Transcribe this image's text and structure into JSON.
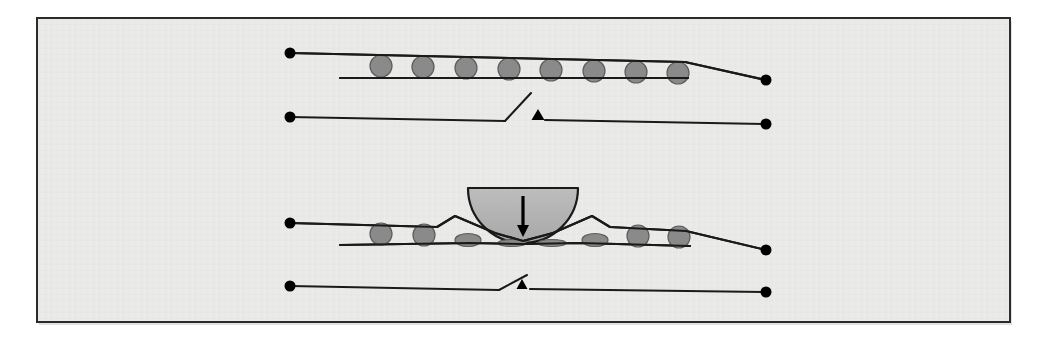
{
  "figure": {
    "panel": {
      "background_color": "#e9e9e7",
      "border_color": "#2b2b2b",
      "x": 37,
      "y": 18,
      "width": 973,
      "height": 304
    },
    "colors": {
      "page_background": "#ffffff",
      "panel_fill": "#e9e9e7",
      "panel_border": "#2b2b2b",
      "line": "#1a1a1a",
      "bead_fill": "#8a8a8a",
      "bead_stroke": "#5d5d5d",
      "indenter_fill": "#b3b3b3",
      "indenter_stroke": "#1a1a1a",
      "node_dot": "#000000",
      "arrow": "#000000"
    }
  },
  "panels": [
    {
      "id": "upper",
      "name": "undeformed-state",
      "label": "relaxed / open",
      "channel": {
        "left_node": {
          "x": 290,
          "y": 53
        },
        "right_node": {
          "x": 766,
          "y": 80
        },
        "top_rail": [
          [
            290,
            53
          ],
          [
            685,
            62
          ],
          [
            766,
            80
          ]
        ],
        "bottom_rail": [
          [
            340,
            78
          ],
          [
            688,
            78
          ]
        ],
        "bead_count": 8,
        "bead_radius": 11,
        "beads": [
          {
            "cx": 381,
            "cy": 66,
            "rx": 11,
            "ry": 11,
            "state": "round"
          },
          {
            "cx": 423,
            "cy": 67,
            "rx": 11,
            "ry": 11,
            "state": "round"
          },
          {
            "cx": 466,
            "cy": 68,
            "rx": 11,
            "ry": 11,
            "state": "round"
          },
          {
            "cx": 509,
            "cy": 69,
            "rx": 11,
            "ry": 11,
            "state": "round"
          },
          {
            "cx": 551,
            "cy": 70,
            "rx": 11,
            "ry": 11,
            "state": "round"
          },
          {
            "cx": 594,
            "cy": 71,
            "rx": 11,
            "ry": 11,
            "state": "round"
          },
          {
            "cx": 636,
            "cy": 72,
            "rx": 11,
            "ry": 11,
            "state": "round"
          },
          {
            "cx": 678,
            "cy": 73,
            "rx": 11,
            "ry": 11,
            "state": "round"
          }
        ]
      },
      "contact": {
        "state": "open",
        "gap_px": 33,
        "left_node": {
          "x": 290,
          "y": 117
        },
        "right_node": {
          "x": 766,
          "y": 124
        },
        "left_lead": [
          [
            290,
            117
          ],
          [
            505,
            121
          ]
        ],
        "lever": [
          [
            505,
            121
          ],
          [
            531,
            93
          ]
        ],
        "right_lead": [
          [
            545,
            120
          ],
          [
            766,
            124
          ]
        ],
        "marker": {
          "type": "triangle",
          "x": 538,
          "y": 120,
          "width": 13,
          "height": 11
        }
      }
    },
    {
      "id": "lower",
      "name": "indented-state",
      "label": "compressed / closed",
      "indenter": {
        "shape": "semicircle",
        "cx": 523,
        "cy": 188,
        "radius": 55,
        "top_y": 188,
        "bottom_y": 243,
        "left_x": 468,
        "right_x": 578,
        "arrow": {
          "x": 523,
          "y_from": 196,
          "y_to": 237,
          "direction": "down",
          "label": "applied load"
        }
      },
      "channel": {
        "left_node": {
          "x": 290,
          "y": 223
        },
        "right_node": {
          "x": 766,
          "y": 250
        },
        "top_rail": [
          [
            290,
            223
          ],
          [
            437,
            227
          ],
          [
            455,
            216
          ],
          [
            495,
            233
          ],
          [
            523,
            241
          ],
          [
            553,
            233
          ],
          [
            592,
            216
          ],
          [
            610,
            227
          ],
          [
            686,
            231
          ],
          [
            766,
            250
          ]
        ],
        "bottom_rail": [
          [
            340,
            245
          ],
          [
            470,
            243
          ],
          [
            523,
            244
          ],
          [
            580,
            243
          ],
          [
            690,
            246
          ]
        ],
        "bead_count": 8,
        "beads": [
          {
            "cx": 381,
            "cy": 234,
            "rx": 11,
            "ry": 11,
            "state": "round"
          },
          {
            "cx": 424,
            "cy": 235,
            "rx": 11,
            "ry": 11,
            "state": "round"
          },
          {
            "cx": 468,
            "cy": 240,
            "rx": 13,
            "ry": 6.5,
            "state": "squashed"
          },
          {
            "cx": 512,
            "cy": 243,
            "rx": 14,
            "ry": 3.5,
            "state": "fully-compressed"
          },
          {
            "cx": 552,
            "cy": 243,
            "rx": 14,
            "ry": 3.5,
            "state": "fully-compressed"
          },
          {
            "cx": 595,
            "cy": 240,
            "rx": 13,
            "ry": 6.5,
            "state": "squashed"
          },
          {
            "cx": 638,
            "cy": 236,
            "rx": 11,
            "ry": 11,
            "state": "round"
          },
          {
            "cx": 679,
            "cy": 237,
            "rx": 11,
            "ry": 11,
            "state": "round"
          }
        ]
      },
      "contact": {
        "state": "closed",
        "gap_px": 4,
        "left_node": {
          "x": 290,
          "y": 286
        },
        "right_node": {
          "x": 766,
          "y": 292
        },
        "left_lead": [
          [
            290,
            286
          ],
          [
            499,
            290
          ]
        ],
        "lever": [
          [
            499,
            290
          ],
          [
            527,
            275
          ]
        ],
        "right_lead": [
          [
            530,
            289
          ],
          [
            766,
            292
          ]
        ],
        "marker": {
          "type": "triangle",
          "x": 522,
          "y": 289,
          "width": 11,
          "height": 10
        }
      }
    }
  ]
}
